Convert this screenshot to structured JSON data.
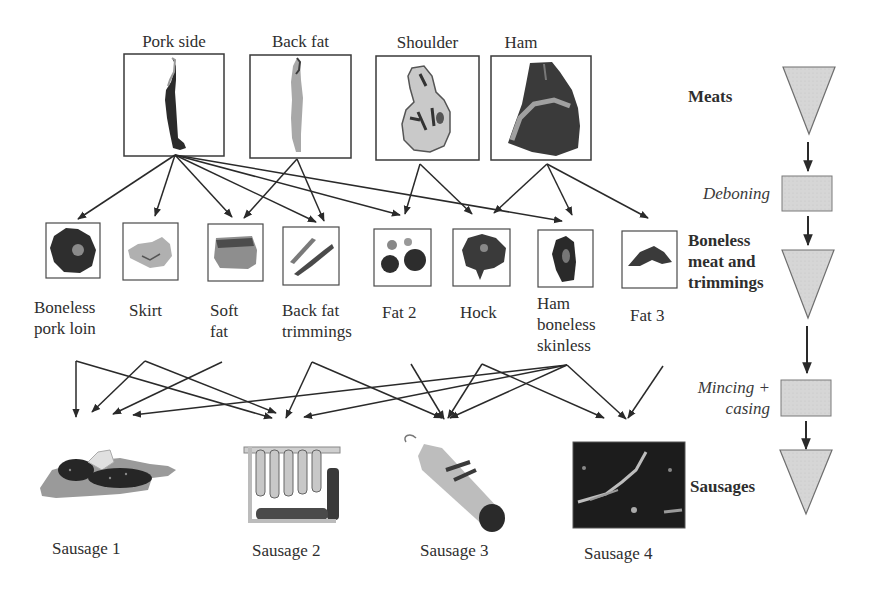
{
  "diagram": {
    "raw_cuts": [
      {
        "id": "pork_side",
        "label": "Pork side",
        "icon": "pork-side-carcass"
      },
      {
        "id": "back_fat",
        "label": "Back fat",
        "icon": "back-fat-strip"
      },
      {
        "id": "shoulder",
        "label": "Shoulder",
        "icon": "shoulder-cut"
      },
      {
        "id": "ham",
        "label": "Ham",
        "icon": "ham-cut"
      }
    ],
    "boneless_pieces": [
      {
        "id": "boneless_pork_loin",
        "label": "Boneless\npork loin",
        "icon": "pork-loin"
      },
      {
        "id": "skirt",
        "label": "Skirt",
        "icon": "skirt-meat"
      },
      {
        "id": "soft_fat",
        "label": "Soft\nfat",
        "icon": "soft-fat"
      },
      {
        "id": "back_fat_trimmings",
        "label": "Back fat\ntrimmings",
        "icon": "back-fat-trimmings"
      },
      {
        "id": "fat_2",
        "label": "Fat 2",
        "icon": "fat-pieces"
      },
      {
        "id": "hock",
        "label": "Hock",
        "icon": "hock-meat"
      },
      {
        "id": "ham_boneless_skinless",
        "label": "Ham\nboneless\nskinless",
        "icon": "ham-boneless"
      },
      {
        "id": "fat_3",
        "label": "Fat 3",
        "icon": "fat-piece"
      }
    ],
    "sausages": [
      {
        "id": "sausage_1",
        "label": "Sausage 1",
        "icon": "sliced-sausage-board"
      },
      {
        "id": "sausage_2",
        "label": "Sausage 2",
        "icon": "hanging-sausages-rack"
      },
      {
        "id": "sausage_3",
        "label": "Sausage 3",
        "icon": "salami-stick"
      },
      {
        "id": "sausage_4",
        "label": "Sausage 4",
        "icon": "sausage-dark-photo"
      }
    ],
    "deboning_edges": [
      [
        "pork_side",
        "boneless_pork_loin"
      ],
      [
        "pork_side",
        "skirt"
      ],
      [
        "pork_side",
        "soft_fat"
      ],
      [
        "pork_side",
        "back_fat_trimmings"
      ],
      [
        "pork_side",
        "fat_2"
      ],
      [
        "pork_side",
        "ham_boneless_skinless"
      ],
      [
        "back_fat",
        "soft_fat"
      ],
      [
        "back_fat",
        "back_fat_trimmings"
      ],
      [
        "shoulder",
        "fat_2"
      ],
      [
        "shoulder",
        "hock"
      ],
      [
        "ham",
        "hock"
      ],
      [
        "ham",
        "ham_boneless_skinless"
      ],
      [
        "ham",
        "fat_3"
      ]
    ],
    "mincing_edges": [
      [
        "boneless_pork_loin",
        "sausage_1"
      ],
      [
        "boneless_pork_loin",
        "sausage_2"
      ],
      [
        "skirt",
        "sausage_1"
      ],
      [
        "skirt",
        "sausage_2"
      ],
      [
        "soft_fat",
        "sausage_1"
      ],
      [
        "back_fat_trimmings",
        "sausage_2"
      ],
      [
        "back_fat_trimmings",
        "sausage_3"
      ],
      [
        "fat_2",
        "sausage_3"
      ],
      [
        "hock",
        "sausage_3"
      ],
      [
        "hock",
        "sausage_4"
      ],
      [
        "ham_boneless_skinless",
        "sausage_1"
      ],
      [
        "ham_boneless_skinless",
        "sausage_2"
      ],
      [
        "ham_boneless_skinless",
        "sausage_3"
      ],
      [
        "ham_boneless_skinless",
        "sausage_4"
      ],
      [
        "fat_3",
        "sausage_4"
      ]
    ],
    "process_flow": {
      "stages": [
        {
          "id": "meats",
          "label": "Meats",
          "shape": "triangle"
        },
        {
          "id": "deboning",
          "label": "Deboning",
          "shape": "rectangle",
          "kind": "process"
        },
        {
          "id": "boneless_meat",
          "label": "Boneless\nmeat and\ntrimmings",
          "shape": "triangle"
        },
        {
          "id": "mincing",
          "label": "Mincing +\ncasing",
          "shape": "rectangle",
          "kind": "process"
        },
        {
          "id": "sausages",
          "label": "Sausages",
          "shape": "triangle"
        }
      ]
    },
    "colors": {
      "line": "#2a2a2a",
      "shape_fill": "#d3d3d3",
      "shape_stroke": "#6f6f6f",
      "box_stroke": "#3a3a3a"
    }
  }
}
